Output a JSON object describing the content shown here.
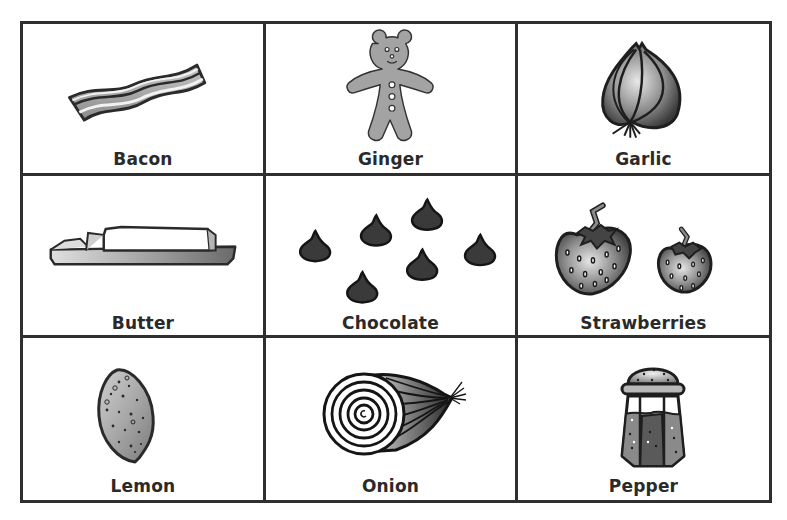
{
  "worksheet": {
    "items": [
      {
        "label": "Bacon",
        "icon": "bacon-icon"
      },
      {
        "label": "Ginger",
        "icon": "gingerbread-man-icon"
      },
      {
        "label": "Garlic",
        "icon": "garlic-icon"
      },
      {
        "label": "Butter",
        "icon": "butter-icon"
      },
      {
        "label": "Chocolate",
        "icon": "chocolate-chips-icon"
      },
      {
        "label": "Strawberries",
        "icon": "strawberries-icon"
      },
      {
        "label": "Lemon",
        "icon": "lemon-icon"
      },
      {
        "label": "Onion",
        "icon": "onion-icon"
      },
      {
        "label": "Pepper",
        "icon": "pepper-shaker-icon"
      }
    ],
    "colors": {
      "border": "#2f2f2f",
      "text": "#2a2a2a",
      "fill_gray": "#9a9a9a",
      "fill_dark": "#3a3a3a"
    }
  }
}
